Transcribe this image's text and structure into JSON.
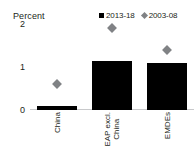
{
  "chart_data": {
    "type": "bar",
    "title": "",
    "ylabel": "Percent",
    "xlabel": "",
    "categories": [
      "China",
      "EAP excl. China",
      "EMDEs"
    ],
    "category_lines": [
      [
        "China"
      ],
      [
        "EAP excl.",
        "China"
      ],
      [
        "EMDEs"
      ]
    ],
    "ylim": [
      0,
      2
    ],
    "yticks": [
      0,
      1,
      2
    ],
    "ytick_labels": [
      "0",
      "1",
      "2"
    ],
    "grid": false,
    "legend_position": "top-right",
    "series": [
      {
        "name": "2013-18",
        "marker": "square",
        "color": "#000000",
        "render": "bar",
        "values": [
          0.1,
          1.15,
          1.1
        ]
      },
      {
        "name": "2003-08",
        "marker": "diamond",
        "color": "#808285",
        "render": "point",
        "values": [
          0.6,
          1.9,
          1.4
        ]
      }
    ]
  },
  "axis": {
    "y_title": "Percent",
    "ticks": [
      {
        "label": "2",
        "value": 2
      },
      {
        "label": "1",
        "value": 1
      },
      {
        "label": "0",
        "value": 0
      }
    ]
  },
  "legend": {
    "items": [
      {
        "label": "2013-18",
        "swatch": "square-marker-icon",
        "color": "#000000"
      },
      {
        "label": "2003-08",
        "swatch": "diamond-marker-icon",
        "color": "#808285"
      }
    ]
  }
}
